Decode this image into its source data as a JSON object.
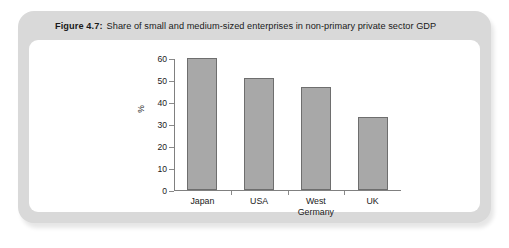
{
  "figure": {
    "label": "Figure 4.7:",
    "caption": "Share of small and medium-sized enterprises in non-primary private sector GDP"
  },
  "colors": {
    "frame": "#d9d9d9",
    "panel": "#ffffff",
    "bar_fill": "#a8a8a8",
    "bar_stroke": "#6e6e6e",
    "axis": "#808080",
    "text": "#1a1a1a"
  },
  "chart_data": {
    "type": "bar",
    "title": "Share of small and medium-sized enterprises in non-primary private sector GDP",
    "categories": [
      "Japan",
      "USA",
      "West Germany",
      "UK"
    ],
    "category_lines": [
      [
        "Japan"
      ],
      [
        "USA"
      ],
      [
        "West",
        "Germany"
      ],
      [
        "UK"
      ]
    ],
    "values": [
      60,
      51,
      47,
      33
    ],
    "xlabel": "",
    "ylabel": "%",
    "ylim": [
      0,
      60
    ],
    "yticks": [
      0,
      10,
      20,
      30,
      40,
      50,
      60
    ],
    "ytick_labels": [
      "0",
      "10",
      "20",
      "30",
      "40",
      "50",
      "60"
    ],
    "grid": false,
    "legend": false
  }
}
